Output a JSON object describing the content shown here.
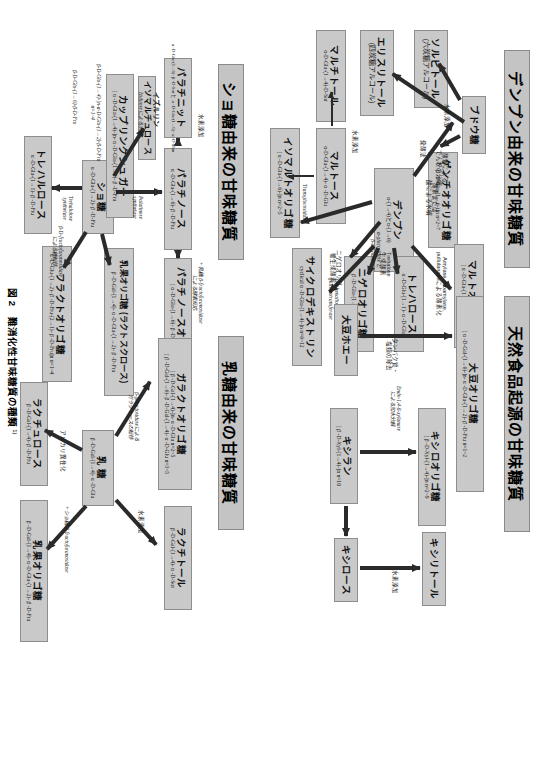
{
  "figure": {
    "caption_number": "図 2",
    "caption_text": "難消化性甘味糖質の種類",
    "caption_note": "1)"
  },
  "sections": [
    {
      "id": "starch",
      "title": "デンプン由来の甘味糖質"
    },
    {
      "id": "natural",
      "title": "天然食品起源の甘味糖質"
    },
    {
      "id": "sucrose",
      "title": "ショ糖由来の甘味糖質"
    },
    {
      "id": "lactose",
      "title": "乳糖由来の甘味糖質"
    }
  ],
  "starch": {
    "nodes": {
      "starch": {
        "name": "デンプン",
        "formula": "α-(1→4)とα-(1→6)"
      },
      "glucose": {
        "name": "ブドウ糖",
        "formula": ""
      },
      "sorbitol": {
        "name": "ソルビトール",
        "sub": "(六炭糖アルコール)"
      },
      "erythritol": {
        "name": "エリスリトール",
        "sub": "(四炭糖アルコール)"
      },
      "maltitol": {
        "name": "マルチトール",
        "formula": "α-D-Glu-(1→4)-D-Sor"
      },
      "maltose": {
        "name": "マルトース",
        "formula": "α-D-Glu-(1→4)- α -D-Glu"
      },
      "gentio": {
        "name": "ゲンチオオリゴ糖",
        "formula": "β -D-Glu-(1→6-)]n n=2~7"
      },
      "malto": {
        "name": "マルトオリゴ糖",
        "formula": "[ α -D-Glu-(1→4)-]n n=2~7"
      },
      "isomalto": {
        "name": "イソマルトオリゴ糖",
        "formula": "[ α -D-Glu-(1→6)-]n n=2~5"
      },
      "trehalose": {
        "name": "トレハロース",
        "formula": "α -D-Glu-(1→1)- α -D-Glu"
      },
      "nigero": {
        "name": "ニゲロオリゴ糖",
        "formula": "β -D-Glu-(1→3)-]n n=2~4"
      },
      "cyclodextrin": {
        "name": "サイクロデキストリン",
        "formula": "cyclical α -D-Glu-(1→4)-]n n=6~12"
      }
    },
    "annotations": {
      "hydrogenation_sorbitol": "水素添加",
      "fermentation": "発酵法",
      "enzyme_hydrolysis_1": "酵素による\nでん粉の分解",
      "enzyme_hydrolysis_2": "酵素または\n酸による水解",
      "hydrogenation_maltitol": "水素添加",
      "alpha_gluco": "α -glucosidase と\nβ -amylase",
      "transglucosidase": "Transglucosidase",
      "trehalose_enzyme": "Trehalose\n生成酵素",
      "nigero_enzyme": "ニゲロオリゴ\n糖生成酵素",
      "cyclo_enzyme": "Cyclomaltodextrin\nglucanotransferase",
      "amylase": "Amylase, Isoamylase,\npullulanaseによる酵素化"
    }
  },
  "natural": {
    "nodes": {
      "soy_whey": {
        "name": "大豆ホエー",
        "formula": ""
      },
      "soy_oligo": {
        "name": "大豆オリゴ糖",
        "formula": "[ α -D-Gal-(1→6)-]n- α -D-Glu-(1→2)- β -D-Fru  n=1~2"
      },
      "xylan": {
        "name": "キシラン",
        "formula": "[ β -D-Xyl-(1→4)-]n  n=10"
      },
      "xylo_oligo": {
        "name": "キシロオリゴ糖",
        "formula": "[ β -D-Xyl-(1→4)-]n  n=2~9"
      },
      "xylose": {
        "name": "キシロース",
        "formula": ""
      },
      "xylitol": {
        "name": "キシリトール",
        "formula": ""
      }
    },
    "annotations": {
      "separation": "タンパク質・\n塩類の除去",
      "endo_xylanase": "Endo-1,4- β -xylanase\nによる加水分解",
      "hydrogenation": "水素添加"
    }
  },
  "sucrose": {
    "nodes": {
      "sucrose": {
        "name": "ショ糖",
        "formula": "α -D-Glu-(1→2)- β -D-Fru"
      },
      "palatinose": {
        "name": "パラチノース",
        "formula": "α -D-Glu-(1→6)- β -D-Fru"
      },
      "palatinit": {
        "name": "パラチニット",
        "formula": "α -D-Glu-(1→6)- β -D-Sor と α -D-Glu-(1→6)- α -D-Man"
      },
      "palatinose_oli": {
        "name": "パラチノースオリゴ糖",
        "formula": "[ α -D-Glu-(1→6)- β -D-Fru]n"
      },
      "coupling": {
        "name": "カップリングシュガー",
        "formula": "[ α -D-Glu-(1→4)-]n- α -D-Glu-(1→2)- β -D-Fru"
      },
      "trehalulose": {
        "name": "トレハルロース",
        "formula": "α -D-Glu-(1→1)- β -D-Fru"
      },
      "fructo": {
        "name": "フラクトオリゴ糖",
        "formula": "α -D-Glu-(1→2)- β -D-Fru-(2→1)- β -D-Fru]n n=1~4"
      },
      "lactosucrose": {
        "name": "乳果オリゴ糖 (ラクトスクロース)",
        "formula": "β -D-Gal-(1→4)- α -D-Glu-(1→2)- β -D-Fru"
      },
      "isomaltulose": {
        "name": "イソマルチュロース",
        "formula": ""
      }
    },
    "annotations": {
      "palatinose_syn": "Palatinose\nsynthetase",
      "hydrogenation": "水素添加",
      "fructofuranosidase_1": "β -fructofuranosidase",
      "trehalulose_syn": "Trehalulose\nsynthetase",
      "fructofuranosidase_2": "β -D-fructofuranosidase\nによる糖転移",
      "lactose_transfer": "+乳糖, β -fructofuranosidase\nによる酵素反応",
      "izuluose": "イズルリン",
      "izuluose_note": "Izuluoseによる水解",
      "cgtase_note": "β -D-Glu-(1→4)-]n- α -D-Glu-(1→2)- β -D-Fru\nn=1~4",
      "branch": "β -D-Glu-(1→6)- β -D-Fru"
    }
  },
  "lactose": {
    "nodes": {
      "lactose": {
        "name": "乳 糖",
        "formula": "β -D-Gal-(1→4)- α -D-Glu"
      },
      "galacto": {
        "name": "ガラクトオリゴ糖",
        "formula": "[ β -D-Gal-(1→4)-]n- α -D-Glu   n=2~5",
        "formula2": "[ β -D-Gal-(1→6)- β -D-Gal-(1→4)- α -D-Glu   n=3~5"
      },
      "lactitol": {
        "name": "ラクチトール",
        "formula": "β -D-Gal-(1→4)- α -D-Sor"
      },
      "lactulose": {
        "name": "ラクチュロース",
        "formula": "β -D-Gal-(1→4)- β -D-Fru"
      },
      "lactosucrose": {
        "name": "乳果オリゴ糖",
        "formula": "β -D-Gal-(1→4)- α -D-Glu-(1→2)- β -D-Fru"
      }
    },
    "annotations": {
      "galactosidase": "β -galactosidaseによる\nガラクトースの転移",
      "hydrogenation": "水素添加",
      "alkali": "アルカリ異性化",
      "fructofuranosidase": "+ショ糖, β -fructofuranosidase"
    }
  },
  "colors": {
    "box_fill": "#c9c9c9",
    "box_border": "#8e8e8e",
    "title_fill": "#c4c4c4",
    "arrow": "#2a2a2a",
    "text": "#111111"
  }
}
